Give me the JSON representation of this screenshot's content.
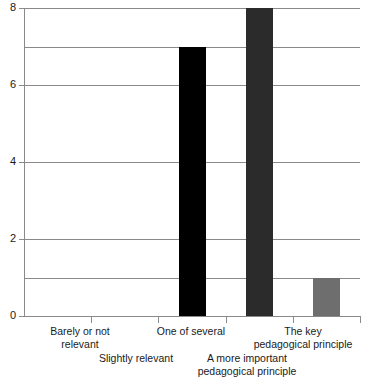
{
  "chart_data": {
    "type": "bar",
    "title": "",
    "subtitle": "",
    "xlabel": "",
    "ylabel": "",
    "categories": [
      "Barely or not relevant",
      "Slightly relevant",
      "One of several",
      "A more important pedagogical principle",
      "The key pedagogical principle"
    ],
    "values": [
      0,
      0,
      7,
      8,
      1
    ],
    "ylim": [
      0,
      8
    ],
    "ytick_labels": [
      "0",
      "2",
      "4",
      "6",
      "8"
    ],
    "ytick_values": [
      0,
      2,
      4,
      6,
      8
    ],
    "gridlines_at": [
      0,
      1,
      2,
      4,
      6,
      7,
      8
    ],
    "grid": true,
    "legend": "none",
    "bar_colors": [
      "#000000",
      "#000000",
      "#000000",
      "#2b2b2b",
      "#6e6e6e"
    ],
    "axis_color": "#8a8a8a",
    "text_color": "#1a1a1a",
    "background": "#ffffff"
  },
  "axis": {
    "y_ticks": [
      {
        "label": "8",
        "value": 8
      },
      {
        "label": "6",
        "value": 6
      },
      {
        "label": "4",
        "value": 4
      },
      {
        "label": "2",
        "value": 2
      },
      {
        "label": "0",
        "value": 0
      }
    ],
    "x_category_labels": [
      {
        "text": "Barely or not\nrelevant",
        "row": "top",
        "center": 80
      },
      {
        "text": "Slightly relevant",
        "row": "bot",
        "center": 136
      },
      {
        "text": "One of several",
        "row": "top",
        "center": 191
      },
      {
        "text": "A more important\npedagogical principle",
        "row": "bot",
        "center": 247
      },
      {
        "text": "The key\npedagogical principle",
        "row": "top",
        "center": 303
      }
    ]
  }
}
